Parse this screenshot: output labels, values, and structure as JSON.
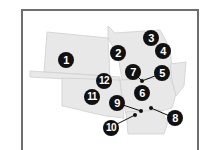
{
  "map": {
    "colors": {
      "land": "#e8e8e8",
      "border": "#cfcfcf",
      "frame": "#6e6e6e",
      "marker": "#111111",
      "marker_text": "#ffffff"
    },
    "markers": [
      {
        "label": "1",
        "x": 66,
        "y": 60
      },
      {
        "label": "2",
        "x": 118,
        "y": 53
      },
      {
        "label": "3",
        "x": 151,
        "y": 38
      },
      {
        "label": "4",
        "x": 163,
        "y": 51
      },
      {
        "label": "5",
        "x": 162,
        "y": 73
      },
      {
        "label": "6",
        "x": 142,
        "y": 93
      },
      {
        "label": "7",
        "x": 133,
        "y": 72
      },
      {
        "label": "8",
        "x": 175,
        "y": 118
      },
      {
        "label": "9",
        "x": 117,
        "y": 103
      },
      {
        "label": "10",
        "x": 111,
        "y": 128
      },
      {
        "label": "11",
        "x": 92,
        "y": 97
      },
      {
        "label": "12",
        "x": 104,
        "y": 81
      }
    ]
  }
}
